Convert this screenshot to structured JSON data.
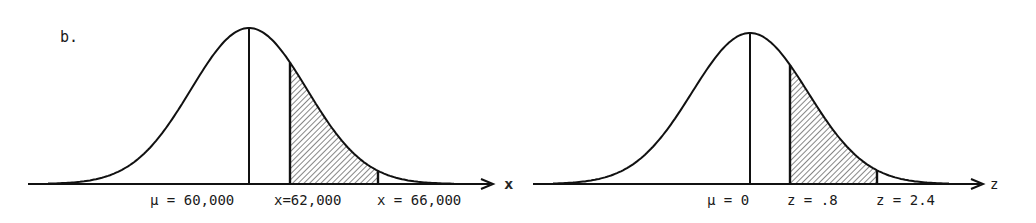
{
  "part_label": "b.",
  "figures": [
    {
      "name": "x-distribution",
      "axis_label": "x",
      "labels": {
        "mean": "μ = 60,000",
        "lower": "x=62,000",
        "upper": "x = 66,000"
      }
    },
    {
      "name": "z-distribution",
      "axis_label": "z",
      "labels": {
        "mean": "μ = 0",
        "lower": "z = .8",
        "upper": "z = 2.4"
      }
    }
  ],
  "chart_data": [
    {
      "type": "area",
      "title": "Normal distribution of x",
      "xlabel": "x",
      "mean": 60000,
      "shaded_region": [
        62000,
        66000
      ],
      "tick_labels": [
        "μ = 60,000",
        "x=62,000",
        "x = 66,000"
      ]
    },
    {
      "type": "area",
      "title": "Standard normal distribution of z",
      "xlabel": "z",
      "mean": 0,
      "shaded_region": [
        0.8,
        2.4
      ],
      "tick_labels": [
        "μ = 0",
        "z = .8",
        "z = 2.4"
      ]
    }
  ]
}
